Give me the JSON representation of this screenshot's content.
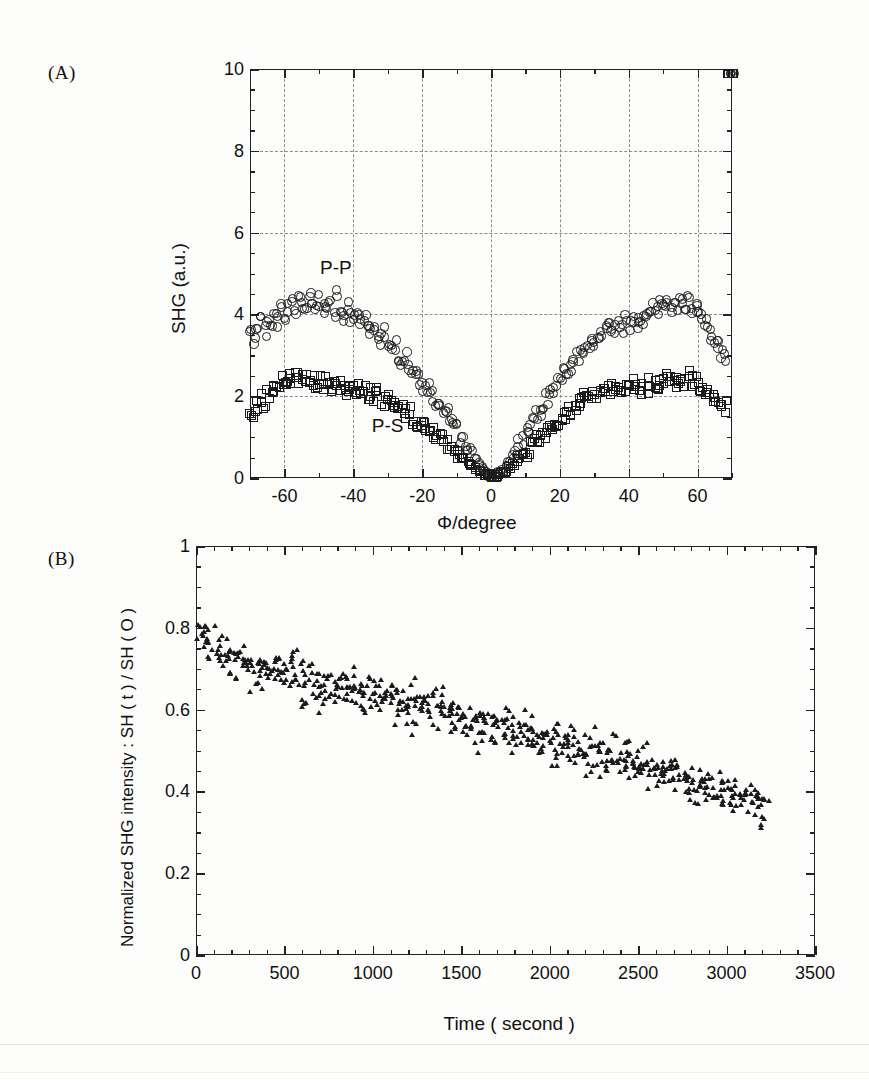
{
  "figure": {
    "panel_a_tag": "(A)",
    "panel_b_tag": "(B)"
  },
  "chart_data": [
    {
      "type": "scatter",
      "panel": "(A)",
      "title": "",
      "xlabel": "Φ/degree",
      "ylabel": "SHG (a.u.)",
      "xlim": [
        -70,
        70
      ],
      "ylim": [
        0,
        10
      ],
      "xticks": [
        -60,
        -40,
        -20,
        0,
        20,
        40,
        60
      ],
      "xtick_labels": [
        "-60",
        "-40",
        "-20",
        "0",
        "20",
        "40",
        "60"
      ],
      "yticks": [
        0,
        2,
        4,
        6,
        8,
        10
      ],
      "ytick_labels": [
        "0",
        "2",
        "4",
        "6",
        "8",
        "10"
      ],
      "x_minor_step": 10,
      "y_minor_step": 0.5,
      "grid": true,
      "grid_style": "dash-dot",
      "legend": "inline-annotations",
      "annotations": [
        {
          "text": "P-P",
          "x": -45,
          "y": 5.1
        },
        {
          "text": "P-S",
          "x": -30,
          "y": 1.25
        }
      ],
      "series": [
        {
          "name": "P-P",
          "marker": "open-circle",
          "x": [
            -70,
            -69,
            -68,
            -67,
            -66,
            -65,
            -64,
            -63,
            -62,
            -61,
            -60,
            -59,
            -58,
            -57,
            -56,
            -55,
            -54,
            -53,
            -52,
            -51,
            -50,
            -49,
            -48,
            -47,
            -46,
            -45,
            -44,
            -43,
            -42,
            -41,
            -40,
            -39,
            -38,
            -37,
            -36,
            -35,
            -34,
            -33,
            -32,
            -31,
            -30,
            -29,
            -28,
            -27,
            -26,
            -25,
            -24,
            -23,
            -22,
            -21,
            -20,
            -19,
            -18,
            -17,
            -16,
            -15,
            -14,
            -13,
            -12,
            -11,
            -10,
            -9,
            -8,
            -7,
            -6,
            -5,
            -4,
            -3,
            -2,
            -1,
            0,
            1,
            2,
            3,
            4,
            5,
            6,
            7,
            8,
            9,
            10,
            11,
            12,
            13,
            14,
            15,
            16,
            17,
            18,
            19,
            20,
            21,
            22,
            23,
            24,
            25,
            26,
            27,
            28,
            29,
            30,
            31,
            32,
            33,
            34,
            35,
            36,
            37,
            38,
            39,
            40,
            41,
            42,
            43,
            44,
            45,
            46,
            47,
            48,
            49,
            50,
            51,
            52,
            53,
            54,
            55,
            56,
            57,
            58,
            59,
            60,
            61,
            62,
            63,
            64,
            65,
            66,
            67,
            68,
            69,
            70
          ],
          "y": [
            3.55,
            3.4,
            3.72,
            3.85,
            3.6,
            3.95,
            3.78,
            4.05,
            3.88,
            4.12,
            4.0,
            4.22,
            4.35,
            4.1,
            4.45,
            4.28,
            4.15,
            4.4,
            4.3,
            4.18,
            4.38,
            4.2,
            4.05,
            4.3,
            4.1,
            4.55,
            4.02,
            3.95,
            4.2,
            4.0,
            3.9,
            4.05,
            3.8,
            3.95,
            3.7,
            3.6,
            3.72,
            3.5,
            3.4,
            3.55,
            3.3,
            3.15,
            3.25,
            3.0,
            2.9,
            2.95,
            2.75,
            2.6,
            2.65,
            2.45,
            2.3,
            2.2,
            2.25,
            2.05,
            1.9,
            1.8,
            1.7,
            1.6,
            1.45,
            1.35,
            1.2,
            1.05,
            0.95,
            0.8,
            0.65,
            0.5,
            0.38,
            0.28,
            0.18,
            0.12,
            0.08,
            0.1,
            0.14,
            0.2,
            0.3,
            0.42,
            0.55,
            0.7,
            0.85,
            1.0,
            1.15,
            1.3,
            1.42,
            1.55,
            1.68,
            1.8,
            1.95,
            2.05,
            2.18,
            2.3,
            2.42,
            2.55,
            2.62,
            2.75,
            2.88,
            2.95,
            3.05,
            3.15,
            3.22,
            3.32,
            3.4,
            3.48,
            3.55,
            3.62,
            3.7,
            3.75,
            3.6,
            3.82,
            3.7,
            3.88,
            3.78,
            3.95,
            3.85,
            4.02,
            3.92,
            4.1,
            4.0,
            4.18,
            4.05,
            4.25,
            4.12,
            4.32,
            4.2,
            4.4,
            4.28,
            4.45,
            4.3,
            4.38,
            4.2,
            4.25,
            4.08,
            4.0,
            3.85,
            3.7,
            3.55,
            3.4,
            3.25,
            3.1,
            3.05
          ],
          "count": 141
        },
        {
          "name": "P-S",
          "marker": "open-square",
          "x": [
            -70,
            -69,
            -68,
            -67,
            -66,
            -65,
            -64,
            -63,
            -62,
            -61,
            -60,
            -59,
            -58,
            -57,
            -56,
            -55,
            -54,
            -53,
            -52,
            -51,
            -50,
            -49,
            -48,
            -47,
            -46,
            -45,
            -44,
            -43,
            -42,
            -41,
            -40,
            -39,
            -38,
            -37,
            -36,
            -35,
            -34,
            -33,
            -32,
            -31,
            -30,
            -29,
            -28,
            -27,
            -26,
            -25,
            -24,
            -23,
            -22,
            -21,
            -20,
            -19,
            -18,
            -17,
            -16,
            -15,
            -14,
            -13,
            -12,
            -11,
            -10,
            -9,
            -8,
            -7,
            -6,
            -5,
            -4,
            -3,
            -2,
            -1,
            0,
            1,
            2,
            3,
            4,
            5,
            6,
            7,
            8,
            9,
            10,
            11,
            12,
            13,
            14,
            15,
            16,
            17,
            18,
            19,
            20,
            21,
            22,
            23,
            24,
            25,
            26,
            27,
            28,
            29,
            30,
            31,
            32,
            33,
            34,
            35,
            36,
            37,
            38,
            39,
            40,
            41,
            42,
            43,
            44,
            45,
            46,
            47,
            48,
            49,
            50,
            51,
            52,
            53,
            54,
            55,
            56,
            57,
            58,
            59,
            60,
            61,
            62,
            63,
            64,
            65,
            66,
            67,
            68,
            69,
            70
          ],
          "y": [
            1.72,
            1.68,
            1.8,
            1.95,
            1.85,
            2.1,
            2.05,
            2.25,
            2.18,
            2.4,
            2.35,
            2.52,
            2.45,
            2.58,
            2.48,
            2.42,
            2.5,
            2.38,
            2.45,
            2.3,
            2.4,
            2.28,
            2.35,
            2.22,
            2.3,
            2.42,
            2.25,
            2.32,
            2.2,
            2.28,
            2.15,
            2.22,
            2.1,
            2.18,
            2.05,
            2.12,
            2.0,
            2.08,
            1.95,
            1.88,
            1.92,
            1.8,
            1.72,
            1.78,
            1.65,
            1.58,
            1.62,
            1.5,
            1.42,
            1.45,
            1.32,
            1.25,
            1.28,
            1.15,
            1.08,
            1.0,
            0.92,
            0.85,
            0.78,
            0.7,
            0.62,
            0.55,
            0.48,
            0.4,
            0.33,
            0.26,
            0.2,
            0.15,
            0.11,
            0.08,
            0.06,
            0.08,
            0.11,
            0.15,
            0.21,
            0.28,
            0.36,
            0.44,
            0.52,
            0.6,
            0.68,
            0.76,
            0.84,
            0.92,
            1.0,
            1.08,
            1.16,
            1.24,
            1.32,
            1.4,
            1.48,
            1.56,
            1.62,
            1.7,
            1.76,
            1.82,
            1.88,
            1.94,
            1.98,
            2.02,
            2.05,
            2.08,
            2.12,
            2.15,
            2.18,
            2.2,
            2.12,
            2.22,
            2.15,
            2.25,
            2.18,
            2.28,
            2.2,
            2.3,
            2.22,
            2.32,
            2.25,
            2.35,
            2.28,
            2.38,
            2.3,
            2.42,
            2.35,
            2.45,
            2.38,
            2.5,
            2.42,
            2.52,
            2.4,
            2.45,
            2.32,
            2.25,
            2.15,
            2.05,
            1.95,
            1.88,
            1.82,
            1.78,
            1.8
          ],
          "count": 141
        }
      ]
    },
    {
      "type": "scatter",
      "panel": "(B)",
      "title": "",
      "xlabel": "Time ( second )",
      "ylabel": "Normalized SHG intensity : SH ( t ) / SH ( O )",
      "xlim": [
        0,
        3500
      ],
      "ylim": [
        0,
        1
      ],
      "xticks": [
        0,
        500,
        1000,
        1500,
        2000,
        2500,
        3000,
        3500
      ],
      "xtick_labels": [
        "0",
        "500",
        "1000",
        "1500",
        "2000",
        "2500",
        "3000",
        "3500"
      ],
      "yticks": [
        0,
        0.2,
        0.4,
        0.6,
        0.8,
        1
      ],
      "ytick_labels": [
        "0",
        "0.2",
        "0.4",
        "0.6",
        "0.8",
        "1"
      ],
      "x_minor_step": 100,
      "y_minor_step": 0.05,
      "grid": false,
      "series": [
        {
          "name": "Normalized SHG decay",
          "marker": "filled-triangle",
          "trend": "monotonic decay from ~0.78 at t=0 to ~0.36 at t=3200",
          "scatter_spread": 0.09,
          "x_range": [
            10,
            3230
          ],
          "points": 620,
          "fit_start_y": 0.78,
          "fit_end_y": 0.355,
          "samples_x": [
            20,
            60,
            100,
            140,
            180,
            220,
            260,
            300,
            340,
            380,
            420,
            460,
            500,
            540,
            580,
            620,
            660,
            700,
            740,
            780,
            820,
            860,
            900,
            940,
            980,
            1020,
            1060,
            1100,
            1140,
            1180,
            1220,
            1260,
            1300,
            1340,
            1380,
            1420,
            1460,
            1500,
            1540,
            1580,
            1620,
            1660,
            1700,
            1740,
            1780,
            1820,
            1860,
            1900,
            1940,
            1980,
            2020,
            2060,
            2100,
            2140,
            2180,
            2220,
            2260,
            2300,
            2340,
            2380,
            2420,
            2460,
            2500,
            2540,
            2580,
            2620,
            2660,
            2700,
            2740,
            2780,
            2820,
            2860,
            2900,
            2940,
            2980,
            3020,
            3060,
            3100,
            3140,
            3180,
            3220
          ],
          "samples_y": [
            0.8,
            0.77,
            0.75,
            0.74,
            0.73,
            0.72,
            0.715,
            0.71,
            0.705,
            0.7,
            0.695,
            0.69,
            0.685,
            0.68,
            0.675,
            0.67,
            0.668,
            0.665,
            0.66,
            0.655,
            0.652,
            0.648,
            0.645,
            0.64,
            0.638,
            0.635,
            0.63,
            0.625,
            0.62,
            0.615,
            0.61,
            0.605,
            0.6,
            0.598,
            0.595,
            0.59,
            0.585,
            0.58,
            0.575,
            0.57,
            0.565,
            0.56,
            0.558,
            0.555,
            0.55,
            0.545,
            0.54,
            0.535,
            0.53,
            0.525,
            0.52,
            0.515,
            0.51,
            0.505,
            0.5,
            0.498,
            0.495,
            0.49,
            0.485,
            0.48,
            0.475,
            0.47,
            0.465,
            0.46,
            0.455,
            0.45,
            0.445,
            0.44,
            0.435,
            0.43,
            0.425,
            0.42,
            0.415,
            0.41,
            0.405,
            0.4,
            0.395,
            0.385,
            0.378,
            0.37,
            0.36
          ]
        }
      ]
    }
  ]
}
